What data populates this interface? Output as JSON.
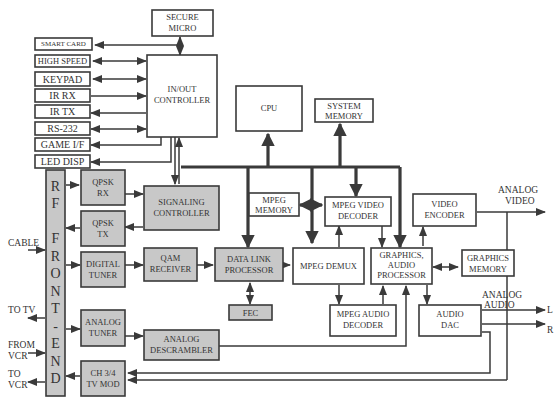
{
  "blocks": {
    "secure_micro": [
      "SECURE",
      "MICRO"
    ],
    "smart_card": "SMART CARD",
    "high_speed": "HIGH SPEED",
    "keypad": "KEYPAD",
    "ir_rx": "IR RX",
    "ir_tx": "IR TX",
    "rs232": "RS-232",
    "game_if": "GAME I/F",
    "led_disp": "LED DISP",
    "io_controller": [
      "IN/OUT",
      "CONTROLLER"
    ],
    "cpu": "CPU",
    "system_memory": [
      "SYSTEM",
      "MEMORY"
    ],
    "rf_front_end": [
      "R",
      "F",
      "",
      "F",
      "R",
      "O",
      "N",
      "T",
      "-",
      "E",
      "N",
      "D"
    ],
    "qpsk_rx": [
      "QPSK",
      "RX"
    ],
    "qpsk_tx": [
      "QPSK",
      "TX"
    ],
    "signaling_controller": [
      "SIGNALING",
      "CONTROLLER"
    ],
    "digital_tuner": [
      "DIGITAL",
      "TUNER"
    ],
    "qam_receiver": [
      "QAM",
      "RECEIVER"
    ],
    "data_link_processor": [
      "DATA LINK",
      "PROCESSOR"
    ],
    "fec": "FEC",
    "mpeg_memory": [
      "MPEG",
      "MEMORY"
    ],
    "mpeg_video_decoder": [
      "MPEG VIDEO",
      "DECODER"
    ],
    "mpeg_demux": "MPEG DEMUX",
    "mpeg_audio_decoder": [
      "MPEG AUDIO",
      "DECODER"
    ],
    "graphics_audio_processor": [
      "GRAPHICS,",
      "AUDIO",
      "PROCESSOR"
    ],
    "graphics_memory": [
      "GRAPHICS",
      "MEMORY"
    ],
    "video_encoder": [
      "VIDEO",
      "ENCODER"
    ],
    "audio_dac": [
      "AUDIO",
      "DAC"
    ],
    "analog_tuner": [
      "ANALOG",
      "TUNER"
    ],
    "analog_descrambler": [
      "ANALOG",
      "DESCRAMBLER"
    ],
    "ch34_tv_mod": [
      "CH 3/4",
      "TV MOD"
    ]
  },
  "external_labels": {
    "cable": "CABLE",
    "to_tv": "TO TV",
    "from_vcr": [
      "FROM",
      "VCR"
    ],
    "to_vcr": [
      "TO",
      "VCR"
    ],
    "analog_video": [
      "ANALOG",
      "VIDEO"
    ],
    "analog_audio": [
      "ANALOG",
      "AUDIO"
    ],
    "left": "L",
    "right": "R"
  },
  "colors": {
    "shaded_block": "#c8c8c8",
    "line": "#3a3a3a"
  }
}
